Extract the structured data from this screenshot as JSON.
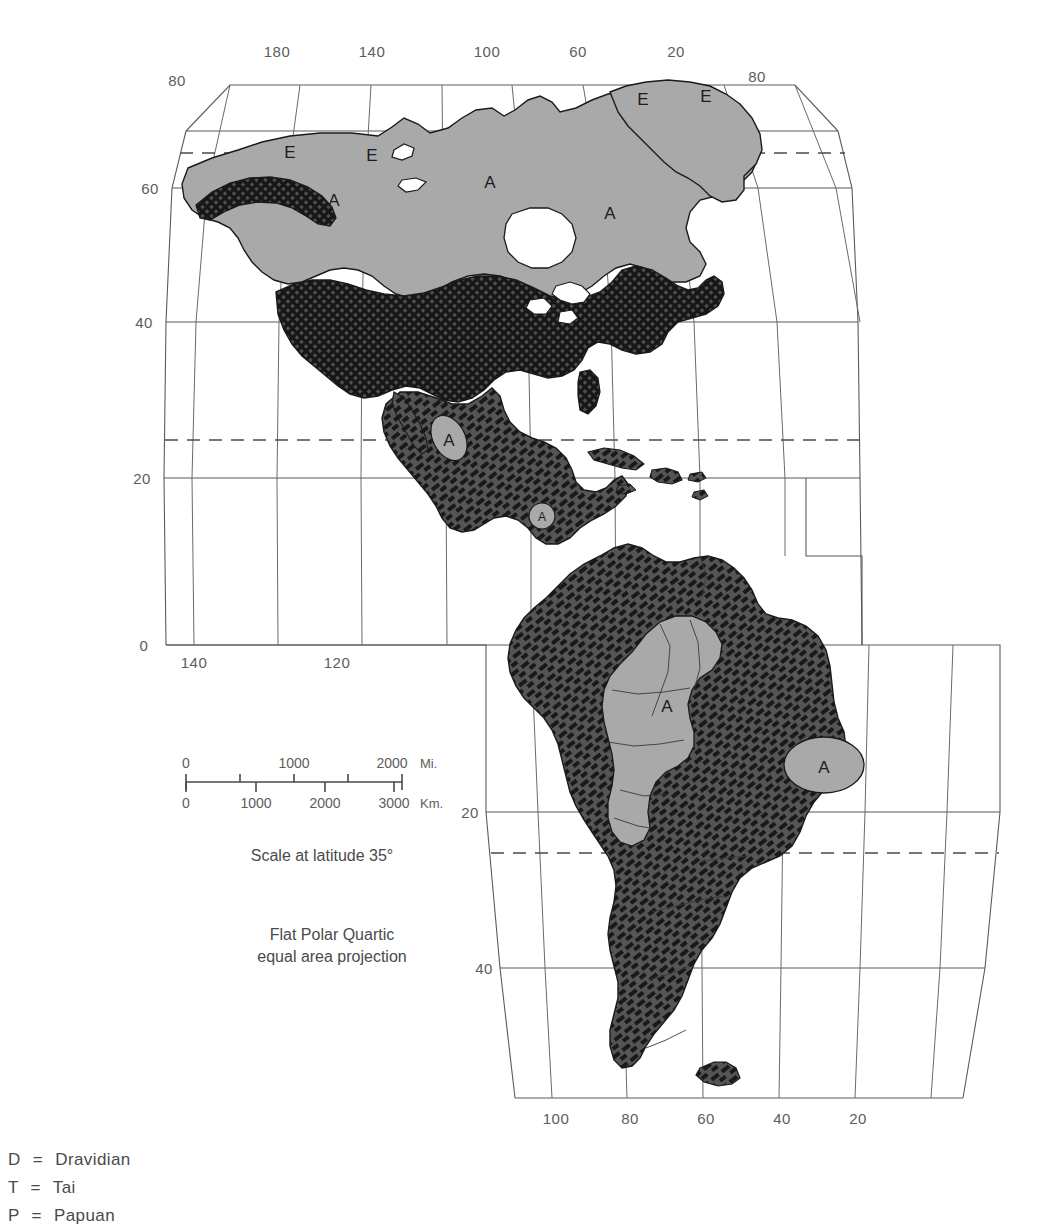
{
  "map": {
    "title_hidden": "",
    "projection_caption_line1": "Flat Polar Quartic",
    "projection_caption_line2": "equal area projection",
    "scale_caption": "Scale at latitude 35°",
    "scale": {
      "miles_unit": "Mi.",
      "km_unit": "Km.",
      "miles_ticks": [
        "0",
        "1000",
        "2000"
      ],
      "km_ticks": [
        "0",
        "1000",
        "2000",
        "3000"
      ]
    },
    "graticule": {
      "top_longitudes": [
        "180",
        "140",
        "100",
        "60",
        "20"
      ],
      "bottom_longitudes": [
        "100",
        "80",
        "60",
        "40",
        "20"
      ],
      "equator_longitudes": [
        "140",
        "120"
      ],
      "left_latitudes": [
        "60",
        "40",
        "20",
        "0"
      ],
      "south_latitudes": [
        "20",
        "40"
      ],
      "corner_latitudes": [
        "80",
        "80"
      ]
    },
    "region_labels": [
      {
        "text": "E",
        "x": 290,
        "y": 152
      },
      {
        "text": "E",
        "x": 372,
        "y": 155
      },
      {
        "text": "E",
        "x": 643,
        "y": 99
      },
      {
        "text": "E",
        "x": 706,
        "y": 96
      },
      {
        "text": "A",
        "x": 334,
        "y": 200
      },
      {
        "text": "A",
        "x": 490,
        "y": 182
      },
      {
        "text": "A",
        "x": 610,
        "y": 213
      },
      {
        "text": "A",
        "x": 449,
        "y": 240
      },
      {
        "text": "A",
        "x": 667,
        "y": 706
      },
      {
        "text": "A",
        "x": 824,
        "y": 765
      }
    ],
    "small_region_labels": [
      {
        "text": "A",
        "x": 542,
        "y": 518
      }
    ],
    "colors": {
      "land_gray": "#a9a9a9",
      "hatch_dark": "#4a4a4a",
      "crosshatch_dark": "#3f3f3f",
      "coast_stroke": "#1a1a1a",
      "grid_stroke": "#5a5a5a",
      "text": "#4a4a4a",
      "background": "#ffffff"
    }
  },
  "legend": {
    "items": [
      {
        "key": "D",
        "eq": "=",
        "label": "Dravidian"
      },
      {
        "key": "T",
        "eq": "=",
        "label": "Tai"
      },
      {
        "key": "P",
        "eq": "=",
        "label": "Papuan"
      }
    ]
  }
}
